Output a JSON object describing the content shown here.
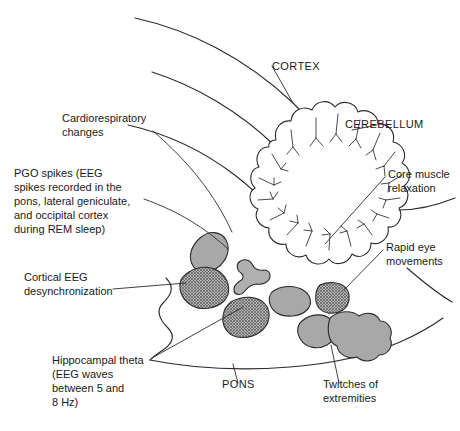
{
  "figure": {
    "colors": {
      "stroke": "#2b2b2b",
      "background": "#ffffff",
      "nucleus_solid_fill": "#a8a8a8",
      "nucleus_hatch_fill": "#9a9a9a",
      "text": "#1a1a1a"
    }
  },
  "labels": {
    "cortex": "CORTEX",
    "cerebellum": "CEREBELLUM",
    "pons": "PONS",
    "cardiorespiratory": [
      "Cardiorespiratory",
      "changes"
    ],
    "pgo_spikes": [
      "PGO spikes (EEG",
      "spikes recorded in the",
      "pons, lateral geniculate,",
      "and occipital cortex",
      "during REM sleep)"
    ],
    "cortical_eeg": [
      "Cortical EEG",
      "desynchronization"
    ],
    "hippocampal_theta": [
      "Hippocampal theta",
      "(EEG waves",
      "between 5 and",
      "8 Hz)"
    ],
    "core_muscle": [
      "Core muscle",
      "relaxation"
    ],
    "rapid_eye": [
      "Rapid eye",
      "movements"
    ],
    "twitches": [
      "Twitches of",
      "extremities"
    ]
  },
  "structures": {
    "nuclei": [
      {
        "name": "upper-left-oval",
        "style": "solid"
      },
      {
        "name": "left-large-hatched",
        "style": "hatched"
      },
      {
        "name": "midline-bowtie",
        "style": "solid"
      },
      {
        "name": "center-rounded",
        "style": "solid"
      },
      {
        "name": "lower-left-hatched",
        "style": "hatched"
      },
      {
        "name": "right-small-hatched",
        "style": "hatched"
      },
      {
        "name": "lower-right-small-lobe",
        "style": "solid"
      },
      {
        "name": "lower-right-large-lobe",
        "style": "solid"
      }
    ]
  }
}
